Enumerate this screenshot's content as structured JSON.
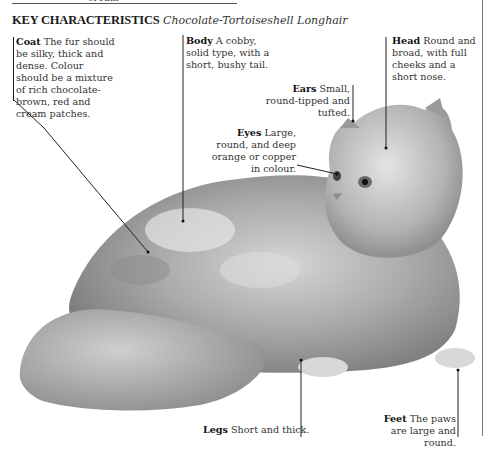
{
  "page": {
    "top_fragment": "cream",
    "heading": {
      "label": "KEY CHARACTERISTICS",
      "breed": "Chocolate-Tortoiseshell Longhair"
    },
    "illustration": {
      "subject": "Chocolate-Tortoiseshell Longhair cat lying down",
      "style": "grayscale illustration"
    },
    "annotations": [
      {
        "id": "coat",
        "term": "Coat",
        "text": "The fur should be silky, thick and dense. Colour should be a mixture of rich chocolate-brown, red and cream patches."
      },
      {
        "id": "body",
        "term": "Body",
        "text": "A cobby, solid type, with a short, bushy tail."
      },
      {
        "id": "head",
        "term": "Head",
        "text": "Round and broad, with full cheeks and a short nose."
      },
      {
        "id": "ears",
        "term": "Ears",
        "text": "Small, round-tipped and tufted."
      },
      {
        "id": "eyes",
        "term": "Eyes",
        "text": "Large, round, and deep orange or copper in colour."
      },
      {
        "id": "legs",
        "term": "Legs",
        "text": "Short and thick."
      },
      {
        "id": "feet",
        "term": "Feet",
        "text": "The paws are large and round."
      }
    ]
  }
}
